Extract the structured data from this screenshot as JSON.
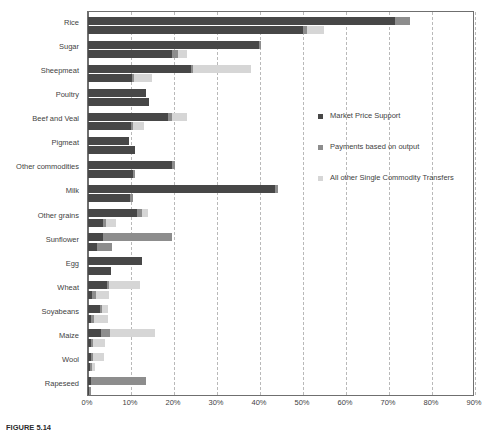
{
  "caption": "FIGURE 5.14",
  "legend": {
    "position": "right",
    "items": [
      {
        "label": "Market Price Support",
        "color": "#474747"
      },
      {
        "label": "Payments based on output",
        "color": "#8d8d8d"
      },
      {
        "label": "All other Single Commodity Transfers",
        "color": "#d6d6d6"
      }
    ]
  },
  "axis": {
    "ticks": [
      "0%",
      "10%",
      "20%",
      "30%",
      "40%",
      "50%",
      "60%",
      "70%",
      "80%",
      "90%"
    ]
  },
  "chart_data": {
    "type": "bar",
    "orientation": "horizontal",
    "stacked": true,
    "title": "",
    "xlabel": "",
    "ylabel": "",
    "xlim": [
      0,
      90
    ],
    "xtick_step": 10,
    "grid": "vertical-dashed",
    "legend_position": "right",
    "series_names": [
      "Market Price Support",
      "Payments based on output",
      "All other Single Commodity Transfers"
    ],
    "series_colors": [
      "#474747",
      "#8d8d8d",
      "#d6d6d6"
    ],
    "bars_per_category": 2,
    "categories": [
      "Rice",
      "Sugar",
      "Sheepmeat",
      "Poultry",
      "Beef and Veal",
      "Pigmeat",
      "Other commodities",
      "Milk",
      "Other grains",
      "Sunflower",
      "Egg",
      "Wheat",
      "Soyabeans",
      "Maize",
      "Wool",
      "Rapeseed"
    ],
    "rows": [
      {
        "category": "Rice",
        "bars": [
          [
            71.5,
            3.5,
            0.0
          ],
          [
            50.0,
            1.0,
            4.0
          ]
        ]
      },
      {
        "category": "Sugar",
        "bars": [
          [
            39.8,
            0.4,
            0.0
          ],
          [
            19.5,
            1.5,
            2.0
          ]
        ]
      },
      {
        "category": "Sheepmeat",
        "bars": [
          [
            24.0,
            0.5,
            13.5
          ],
          [
            10.3,
            0.5,
            4.0
          ]
        ]
      },
      {
        "category": "Poultry",
        "bars": [
          [
            13.5,
            0.0,
            0.0
          ],
          [
            14.3,
            0.0,
            0.0
          ]
        ]
      },
      {
        "category": "Beef and Veal",
        "bars": [
          [
            18.5,
            1.0,
            3.5
          ],
          [
            10.0,
            0.5,
            2.5
          ]
        ]
      },
      {
        "category": "Pigmeat",
        "bars": [
          [
            9.5,
            0.0,
            0.0
          ],
          [
            11.0,
            0.0,
            0.0
          ]
        ]
      },
      {
        "category": "Other commodities",
        "bars": [
          [
            19.5,
            0.8,
            0.0
          ],
          [
            10.5,
            0.5,
            0.0
          ]
        ]
      },
      {
        "category": "Milk",
        "bars": [
          [
            43.5,
            0.8,
            0.0
          ],
          [
            9.8,
            0.7,
            0.0
          ]
        ]
      },
      {
        "category": "Other grains",
        "bars": [
          [
            11.5,
            1.0,
            1.5
          ],
          [
            3.5,
            0.8,
            2.2
          ]
        ]
      },
      {
        "category": "Sunflower",
        "bars": [
          [
            3.5,
            16.0,
            0.0
          ],
          [
            2.0,
            3.5,
            0.0
          ]
        ]
      },
      {
        "category": "Egg",
        "bars": [
          [
            12.5,
            0.0,
            0.0
          ],
          [
            5.3,
            0.0,
            0.0
          ]
        ]
      },
      {
        "category": "Wheat",
        "bars": [
          [
            4.5,
            0.5,
            7.0
          ],
          [
            1.0,
            0.8,
            3.2
          ]
        ]
      },
      {
        "category": "Soyabeans",
        "bars": [
          [
            2.8,
            0.4,
            1.5
          ],
          [
            0.8,
            0.6,
            3.3
          ]
        ]
      },
      {
        "category": "Maize",
        "bars": [
          [
            3.0,
            2.2,
            10.5
          ],
          [
            0.6,
            0.6,
            2.8
          ]
        ]
      },
      {
        "category": "Wool",
        "bars": [
          [
            0.8,
            0.4,
            2.5
          ],
          [
            0.5,
            0.5,
            0.7
          ]
        ]
      },
      {
        "category": "Rapeseed",
        "bars": [
          [
            0.6,
            13.0,
            0.0
          ],
          [
            0.3,
            0.4,
            0.0
          ]
        ]
      }
    ]
  }
}
